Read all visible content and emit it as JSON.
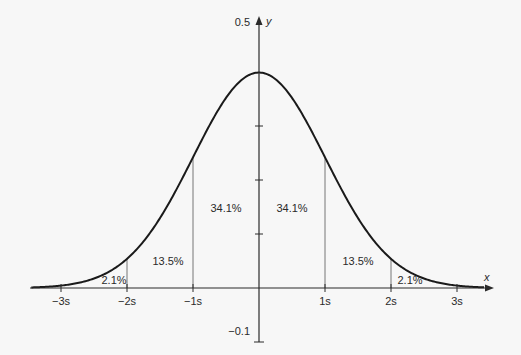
{
  "chart_data": {
    "type": "line",
    "title": "",
    "xlabel": "x",
    "ylabel": "y",
    "x_ticks": [
      "−3s",
      "−2s",
      "−1s",
      "1s",
      "2s",
      "3s"
    ],
    "x_tick_values": [
      -3,
      -2,
      -1,
      1,
      2,
      3
    ],
    "y_tick_labels": [
      {
        "value": 0.5,
        "label": "0.5"
      },
      {
        "value": -0.1,
        "label": "−0.1"
      }
    ],
    "y_tick_marks": [
      0.1,
      0.2,
      0.3
    ],
    "xlim": [
      -3.5,
      3.6
    ],
    "ylim": [
      -0.1,
      0.5
    ],
    "grid": false,
    "curve": {
      "function": "standard normal pdf",
      "mean": 0,
      "sd": 1,
      "peak": 0.399
    },
    "regions": [
      {
        "from": -3,
        "to": -2,
        "label": "2.1%"
      },
      {
        "from": -2,
        "to": -1,
        "label": "13.5%"
      },
      {
        "from": -1,
        "to": 0,
        "label": "34.1%"
      },
      {
        "from": 0,
        "to": 1,
        "label": "34.1%"
      },
      {
        "from": 1,
        "to": 2,
        "label": "13.5%"
      },
      {
        "from": 2,
        "to": 3,
        "label": "2.1%"
      }
    ],
    "divider_lines_at": [
      -2,
      -1,
      1,
      2
    ]
  },
  "colors": {
    "background": "#f7f7f7",
    "curve": "#1a1a1a",
    "axis": "#2a2a2a",
    "divider": "#777777",
    "text": "#2a2a2a"
  }
}
